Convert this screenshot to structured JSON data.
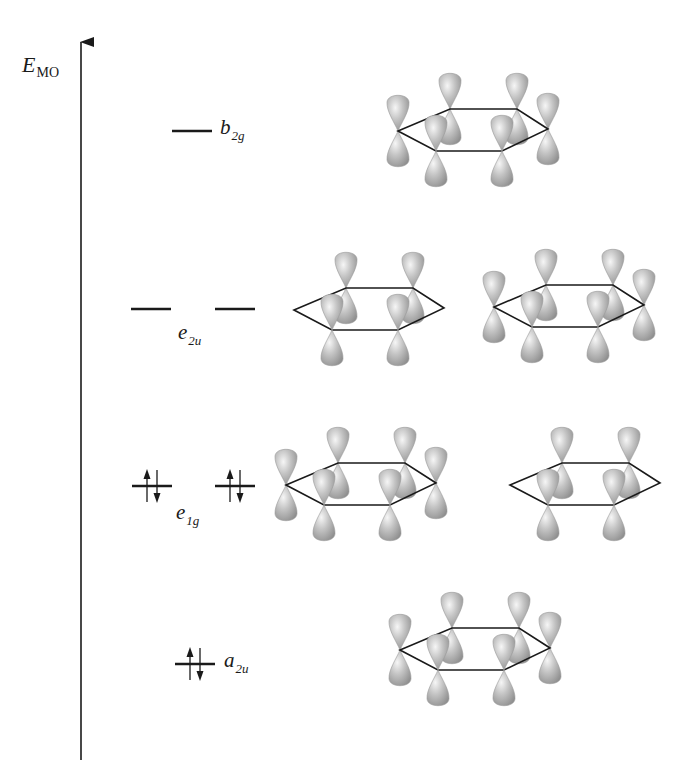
{
  "diagram": {
    "axis": {
      "label_main": "E",
      "label_sub": "MO",
      "x": 81,
      "y_top": 40,
      "y_bottom": 760
    },
    "colors": {
      "line": "#1a1a1a",
      "lobe_fill": "#b8b8b8",
      "lobe_highlight": "#f4f4f4",
      "lobe_shadow": "#8c8c8c"
    },
    "levels": [
      {
        "id": "b2g",
        "label_main": "b",
        "label_sub": "2g",
        "y": 131,
        "lines": [
          [
            172,
            212
          ]
        ],
        "electrons": [
          0
        ],
        "label_x": 220,
        "label_y": 117,
        "occupancy": "empty"
      },
      {
        "id": "e2u",
        "label_main": "e",
        "label_sub": "2u",
        "y": 309,
        "lines": [
          [
            131,
            171
          ],
          [
            215,
            255
          ]
        ],
        "electrons": [
          0,
          0
        ],
        "label_x": 178,
        "label_y": 322,
        "occupancy": "empty"
      },
      {
        "id": "e1g",
        "label_main": "e",
        "label_sub": "1g",
        "y": 486,
        "lines": [
          [
            132,
            172
          ],
          [
            215,
            255
          ]
        ],
        "electrons": [
          2,
          2
        ],
        "label_x": 176,
        "label_y": 502,
        "occupancy": "filled"
      },
      {
        "id": "a2u",
        "label_main": "a",
        "label_sub": "2u",
        "y": 664,
        "lines": [
          [
            175,
            215
          ]
        ],
        "electrons": [
          2
        ],
        "label_x": 224,
        "label_y": 650,
        "occupancy": "filled"
      }
    ],
    "orbitals": [
      {
        "level": "b2g",
        "x": 398,
        "y": 109,
        "atoms": [
          "L",
          "UL",
          "UR",
          "R",
          "LR",
          "LL"
        ],
        "phase": [
          1,
          -1,
          1,
          -1,
          1,
          -1
        ]
      },
      {
        "level": "e2u",
        "x": 294,
        "y": 288,
        "atoms": [
          "UL",
          "UR",
          "LR",
          "LL"
        ],
        "phase": [
          1,
          -1,
          1,
          -1
        ]
      },
      {
        "level": "e2u",
        "x": 494,
        "y": 285,
        "atoms": [
          "L",
          "UL",
          "UR",
          "R",
          "LR",
          "LL"
        ],
        "phase": [
          1,
          -1,
          -1,
          1,
          -1,
          -1
        ]
      },
      {
        "level": "e1g",
        "x": 286,
        "y": 463,
        "atoms": [
          "L",
          "UL",
          "UR",
          "R",
          "LR",
          "LL"
        ],
        "phase": [
          1,
          1,
          -1,
          -1,
          -1,
          1
        ]
      },
      {
        "level": "e1g",
        "x": 510,
        "y": 463,
        "atoms": [
          "UL",
          "UR",
          "LR",
          "LL"
        ],
        "phase": [
          1,
          1,
          -1,
          -1
        ]
      },
      {
        "level": "a2u",
        "x": 400,
        "y": 628,
        "atoms": [
          "L",
          "UL",
          "UR",
          "R",
          "LR",
          "LL"
        ],
        "phase": [
          1,
          1,
          1,
          1,
          1,
          1
        ]
      }
    ]
  }
}
